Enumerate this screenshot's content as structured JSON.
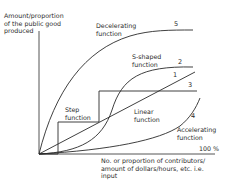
{
  "diagram": {
    "y_axis_label": [
      "Amount/proportion",
      "of the public good",
      "produced"
    ],
    "x_axis_label": [
      "No. or proportion of contributors/",
      "amount of dollars/hours, etc. i.e.",
      "input"
    ],
    "x_axis_end_label": "100 %",
    "curves": [
      {
        "number": "1",
        "name": "Linear function",
        "label_lines": [
          "Linear",
          "function"
        ]
      },
      {
        "number": "2",
        "name": "S-shaped function",
        "label_lines": [
          "S-shaped",
          "function"
        ]
      },
      {
        "number": "3",
        "name": "Step function",
        "label_lines": [
          "Step",
          "function"
        ]
      },
      {
        "number": "4",
        "name": "Accelerating function",
        "label_lines": [
          "Accelerating",
          "function"
        ]
      },
      {
        "number": "5",
        "name": "Decelerating function",
        "label_lines": [
          "Decelerating",
          "function"
        ]
      }
    ],
    "colors": {
      "line": "#2a2a2a",
      "background": "#ffffff"
    }
  }
}
